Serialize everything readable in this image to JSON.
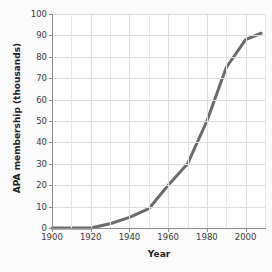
{
  "chart_data": {
    "type": "line",
    "title": "",
    "xlabel": "Year",
    "ylabel": "APA membership (thousands)",
    "xlim": [
      1900,
      2010
    ],
    "ylim": [
      0,
      100
    ],
    "grid": true,
    "legend": null,
    "x_ticks": [
      1900,
      1920,
      1940,
      1960,
      1980,
      2000
    ],
    "x_tick_labels": [
      "1900",
      "1920",
      "1940",
      "1960",
      "1980",
      "2000"
    ],
    "x_minor_tick_step": 10,
    "y_ticks": [
      0,
      10,
      20,
      30,
      40,
      50,
      60,
      70,
      80,
      90,
      100
    ],
    "y_tick_labels": [
      "0",
      "10",
      "20",
      "30",
      "40",
      "50",
      "60",
      "70",
      "80",
      "90",
      "100"
    ],
    "series": [
      {
        "name": "APA membership",
        "color": "#6b6b6b",
        "line_width": 3,
        "x": [
          1900,
          1910,
          1920,
          1930,
          1940,
          1950,
          1960,
          1970,
          1980,
          1990,
          2000,
          2008
        ],
        "values": [
          0,
          0,
          0,
          2,
          5,
          9,
          20,
          30,
          50,
          75,
          88,
          91
        ]
      }
    ]
  },
  "axis": {
    "x_title": "Year",
    "y_title": "APA membership (thousands)"
  },
  "colors": {
    "line": "#6b6b6b",
    "grid": "#dcdcdc",
    "grid_minor": "#e6e6e6",
    "axis": "#8c8c8c",
    "text": "#3a3a3a",
    "title_text": "#222222",
    "plot_background": "#ffffff",
    "canvas_background": "#fbfbfb"
  }
}
